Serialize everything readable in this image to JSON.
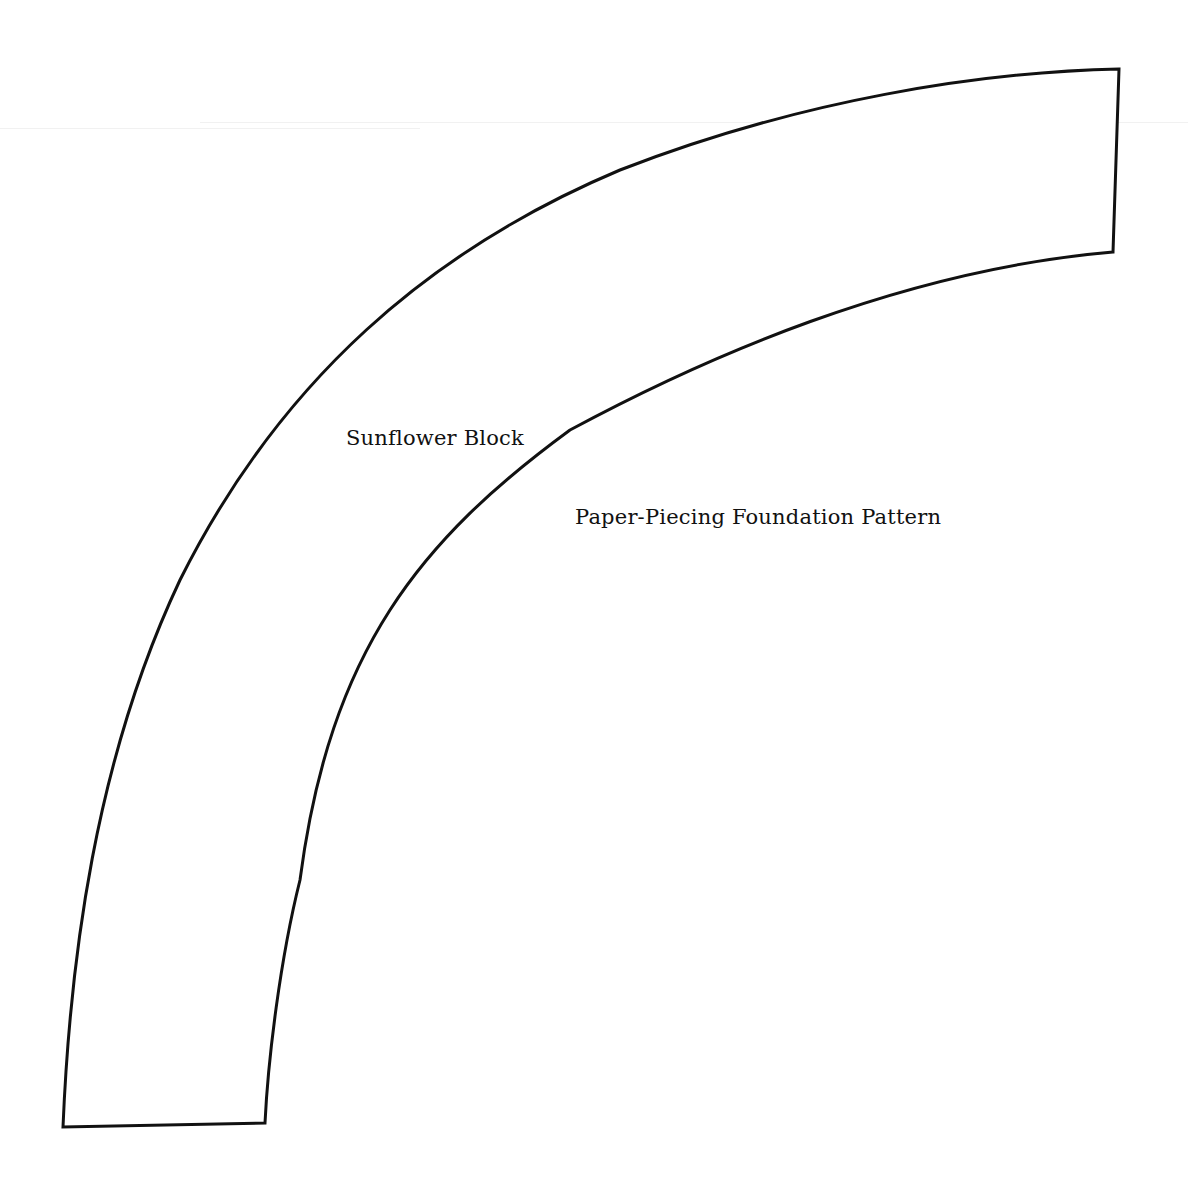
{
  "document": {
    "title": "Sunflower Block",
    "subtitle": "Paper-Piecing Foundation Pattern"
  },
  "shape": {
    "type": "quarter-arc-band",
    "stroke_color": "#111111",
    "fill_color": "#ffffff"
  },
  "colors": {
    "background": "#ffffff",
    "ink": "#111111"
  }
}
